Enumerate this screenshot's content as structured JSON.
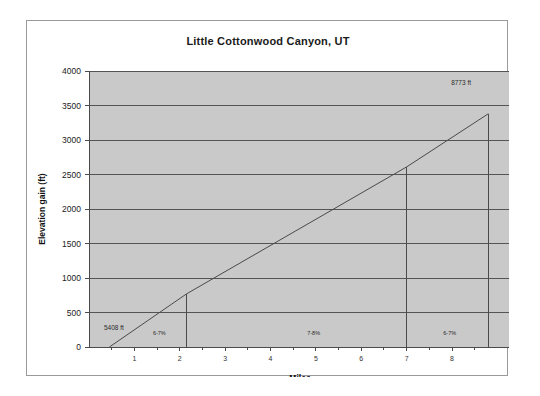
{
  "chart_data": {
    "type": "line",
    "title": "Little Cottonwood Canyon, UT",
    "xlabel": "Miles",
    "ylabel": "Elevation gain (ft)",
    "xlim": [
      0,
      9.3
    ],
    "ylim": [
      0,
      4000
    ],
    "grid": true,
    "legend": "none",
    "x_ticks": [
      1,
      2,
      3,
      4,
      5,
      6,
      7,
      8
    ],
    "x_tick_labels": [
      "1",
      "2",
      "3",
      "4",
      "5",
      "6",
      "7",
      "8"
    ],
    "y_ticks": [
      0,
      500,
      1000,
      1500,
      2000,
      2500,
      3000,
      3500,
      4000
    ],
    "y_tick_labels": [
      "0",
      "500",
      "1000",
      "1500",
      "2000",
      "2500",
      "3000",
      "3500",
      "4000"
    ],
    "series": [
      {
        "name": "Elevation gain",
        "x": [
          0.45,
          2.15,
          7.0,
          8.8
        ],
        "values": [
          0,
          770,
          2610,
          3380
        ]
      }
    ],
    "segment_markers": [
      {
        "x": 2.15,
        "y": 770
      },
      {
        "x": 7.0,
        "y": 2610
      },
      {
        "x": 8.8,
        "y": 3380
      }
    ],
    "annotations": [
      {
        "name": "start-elevation",
        "text": "5408 ft",
        "x": 0.55,
        "y": 250
      },
      {
        "name": "end-elevation",
        "text": "8773 ft",
        "x": 8.2,
        "y": 3800
      },
      {
        "name": "grade-segment-1",
        "text": "6-7%",
        "x": 1.55,
        "y": 175
      },
      {
        "name": "grade-segment-2",
        "text": "7-8%",
        "x": 4.95,
        "y": 175
      },
      {
        "name": "grade-segment-3",
        "text": "6-7%",
        "x": 7.95,
        "y": 175
      }
    ],
    "colors": {
      "plot_background": "#c9c9c9",
      "gridline": "#545454",
      "data_line": "#4a4a4a",
      "axis_line": "#4a4a4a",
      "frame_border": "#9a9a9a",
      "title_text": "#1a1a1a"
    }
  }
}
